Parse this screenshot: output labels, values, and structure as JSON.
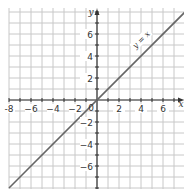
{
  "chart_data": {
    "type": "line",
    "title": "",
    "xlabel": "x",
    "ylabel": "y",
    "xlim": [
      -8,
      8
    ],
    "ylim": [
      -8,
      8
    ],
    "grid": true,
    "grid_step": 1,
    "x_ticks": [
      -8,
      -6,
      -4,
      -2,
      2,
      4,
      6
    ],
    "x_tick_labels": [
      "-8",
      "−6",
      "−4",
      "−2",
      "2",
      "4",
      "6"
    ],
    "y_ticks": [
      6,
      4,
      2,
      -2,
      -4,
      -6
    ],
    "y_tick_labels": [
      "6",
      "4",
      "2",
      "−2",
      "−4",
      "−6"
    ],
    "origin_label": "0",
    "series": [
      {
        "name": "y = x",
        "label": "y = x",
        "x": [
          -8,
          8
        ],
        "y": [
          -8,
          8
        ],
        "color": "#666666"
      }
    ]
  },
  "colors": {
    "grid": "#c8c8c8",
    "axis": "#333333",
    "line": "#666666"
  }
}
